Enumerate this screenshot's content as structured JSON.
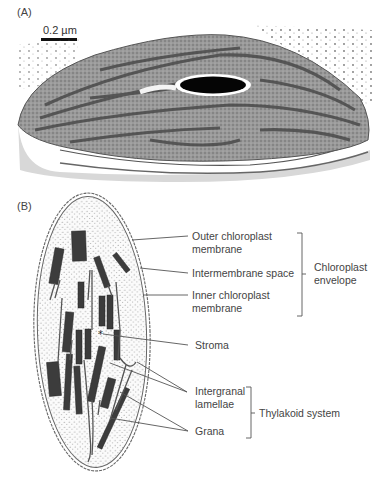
{
  "panel_a": {
    "label": "(A)",
    "scale_bar": {
      "text": "0.2 µm"
    }
  },
  "panel_b": {
    "label": "(B)",
    "structure_labels": [
      {
        "id": "outer",
        "line1": "Outer chloroplast",
        "line2": "membrane"
      },
      {
        "id": "intermembrane",
        "line1": "Intermembrane space",
        "line2": ""
      },
      {
        "id": "inner",
        "line1": "Inner chloroplast",
        "line2": "membrane"
      },
      {
        "id": "stroma",
        "line1": "Stroma",
        "line2": ""
      },
      {
        "id": "intergranal",
        "line1": "Intergranal",
        "line2": "lamellae"
      },
      {
        "id": "grana",
        "line1": "Grana",
        "line2": ""
      }
    ],
    "groups": [
      {
        "id": "envelope",
        "line1": "Chloroplast",
        "line2": "envelope"
      },
      {
        "id": "thylakoid",
        "line1": "Thylakoid system",
        "line2": ""
      }
    ]
  }
}
